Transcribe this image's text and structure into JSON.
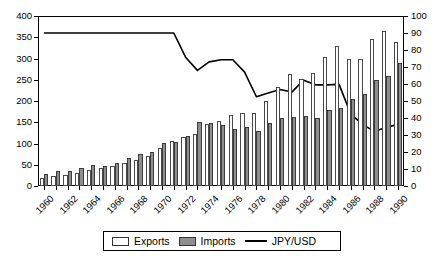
{
  "chart_data": {
    "type": "bar",
    "title": "",
    "subtitle": "",
    "xlabel": "",
    "ylabel": "",
    "y2label": "",
    "grid": false,
    "legend_position": "bottom",
    "x": [
      1960,
      1961,
      1962,
      1963,
      1964,
      1965,
      1966,
      1967,
      1968,
      1969,
      1970,
      1971,
      1972,
      1973,
      1974,
      1975,
      1976,
      1977,
      1978,
      1979,
      1980,
      1981,
      1982,
      1983,
      1984,
      1985,
      1986,
      1987,
      1988,
      1989,
      1990
    ],
    "categories": [
      "1960",
      "1961",
      "1962",
      "1963",
      "1964",
      "1965",
      "1966",
      "1967",
      "1968",
      "1969",
      "1970",
      "1971",
      "1972",
      "1973",
      "1974",
      "1975",
      "1976",
      "1977",
      "1978",
      "1979",
      "1980",
      "1981",
      "1982",
      "1983",
      "1984",
      "1985",
      "1986",
      "1987",
      "1988",
      "1989",
      "1990"
    ],
    "xtick_labels": [
      "1960",
      "1962",
      "1964",
      "1966",
      "1968",
      "1970",
      "1972",
      "1974",
      "1976",
      "1978",
      "1980",
      "1982",
      "1984",
      "1986",
      "1988",
      "1990"
    ],
    "ylim": [
      0,
      400
    ],
    "yticks": [
      0,
      50,
      100,
      150,
      200,
      250,
      300,
      350,
      400
    ],
    "y2lim": [
      0,
      100
    ],
    "y2ticks": [
      0,
      10,
      20,
      30,
      40,
      50,
      60,
      70,
      80,
      90,
      100
    ],
    "series": [
      {
        "name": "Exports",
        "kind": "bar",
        "axis": "left",
        "color": "#fdfdfd",
        "values": [
          20,
          24,
          27,
          30,
          37,
          43,
          48,
          54,
          62,
          70,
          90,
          105,
          116,
          123,
          147,
          152,
          168,
          172,
          172,
          200,
          232,
          263,
          252,
          265,
          304,
          330,
          300,
          300,
          345,
          365,
          340
        ]
      },
      {
        "name": "Imports",
        "kind": "bar",
        "axis": "left",
        "color": "#8e8e8e",
        "values": [
          29,
          35,
          36,
          43,
          50,
          47,
          55,
          67,
          75,
          79,
          101,
          103,
          117,
          150,
          148,
          143,
          135,
          140,
          130,
          148,
          161,
          162,
          164,
          160,
          180,
          183,
          205,
          216,
          250,
          260,
          290
        ]
      },
      {
        "name": "JPY/USD",
        "kind": "line",
        "axis": "left",
        "color": "#000000",
        "values": [
          360,
          360,
          360,
          360,
          360,
          360,
          360,
          360,
          360,
          360,
          360,
          360,
          303,
          272,
          292,
          297,
          297,
          268,
          210,
          219,
          227,
          221,
          249,
          238,
          238,
          239,
          169,
          145,
          128,
          138,
          145
        ]
      }
    ],
    "annotations": []
  },
  "legend": {
    "items": [
      {
        "label": "Exports",
        "swatch": "white-rect-swatch"
      },
      {
        "label": "Imports",
        "swatch": "gray-rect-swatch"
      },
      {
        "label": "JPY/USD",
        "swatch": "black-line-swatch"
      }
    ]
  },
  "colors": {
    "exports_fill": "#fdfdfd",
    "imports_fill": "#8e8e8e",
    "line": "#000000",
    "axis": "#000000",
    "background": "#ffffff"
  }
}
